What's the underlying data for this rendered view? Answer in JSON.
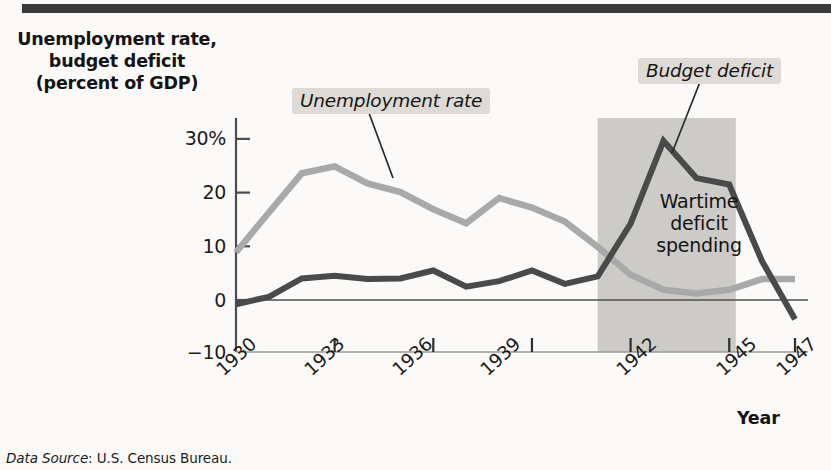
{
  "figure": {
    "y_axis_title": "Unemployment rate,\nbudget deficit\n(percent of GDP)",
    "y_axis_title_lines": [
      "Unemployment rate,",
      "budget deficit",
      "(percent of GDP)"
    ],
    "x_axis_title": "Year",
    "source_prefix": "Data Source",
    "source_text": ": U.S. Census Bureau.",
    "band_label_lines": [
      "Wartime",
      "deficit",
      "spending"
    ],
    "legend": {
      "unemployment": "Unemployment rate",
      "deficit": "Budget deficit"
    },
    "colors": {
      "unemployment_line": "#a9a9a9",
      "deficit_line": "#4a4a4a",
      "band_fill": "#cdcbc7",
      "callout_fill": "#dedbd6",
      "axis": "#4d4d4d",
      "top_rule": "#3a3a3a",
      "background": "#fbfaf8"
    }
  },
  "chart_data": {
    "type": "line",
    "title": "",
    "xlabel": "Year",
    "ylabel": "Unemployment rate, budget deficit (percent of GDP)",
    "xlim": [
      1930,
      1947
    ],
    "ylim": [
      -10,
      32
    ],
    "xticks": [
      1930,
      1933,
      1936,
      1939,
      1942,
      1945,
      1947
    ],
    "xtick_labels": [
      "1930",
      "1933",
      "1936",
      "1939",
      "1942",
      "1945",
      "1947"
    ],
    "yticks": [
      -10,
      0,
      10,
      20,
      30
    ],
    "ytick_labels": [
      "−10",
      "0",
      "10",
      "20",
      "30%"
    ],
    "grid": false,
    "legend_position": "inline-callout",
    "x": [
      1930,
      1931,
      1932,
      1933,
      1934,
      1935,
      1936,
      1937,
      1938,
      1939,
      1940,
      1941,
      1942,
      1943,
      1944,
      1945,
      1946,
      1947
    ],
    "series": [
      {
        "name": "Unemployment rate",
        "color": "#a9a9a9",
        "values": [
          8.9,
          16.3,
          23.6,
          24.9,
          21.7,
          20.1,
          16.9,
          14.3,
          19.0,
          17.2,
          14.6,
          9.9,
          4.7,
          1.9,
          1.2,
          1.9,
          3.9,
          3.9
        ]
      },
      {
        "name": "Budget deficit",
        "color": "#4a4a4a",
        "values": [
          -0.8,
          0.6,
          4.0,
          4.5,
          3.9,
          4.0,
          5.5,
          2.5,
          3.5,
          5.5,
          3.0,
          4.4,
          14.2,
          29.6,
          22.7,
          21.5,
          7.2,
          -3.6
        ]
      }
    ],
    "shaded_region": {
      "label": "Wartime deficit spending",
      "x_start": 1941.0,
      "x_end": 1945.2,
      "fill": "#cdcbc7"
    },
    "annotations": [
      {
        "text": "Unemployment rate",
        "points_to_series": "Unemployment rate",
        "points_to_x": 1935.5
      },
      {
        "text": "Budget deficit",
        "points_to_series": "Budget deficit",
        "points_to_x": 1943.3
      }
    ]
  }
}
